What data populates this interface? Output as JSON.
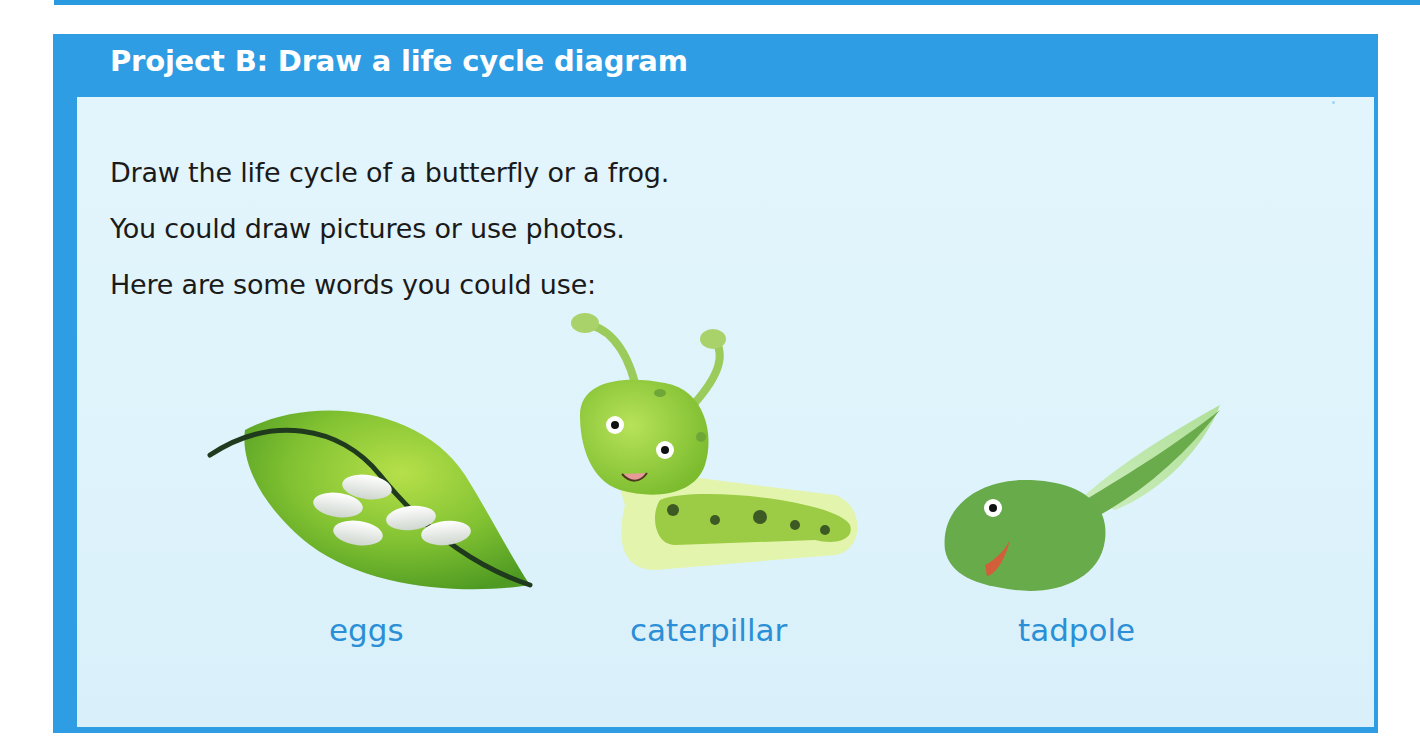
{
  "card": {
    "title": "Project B: Draw a life cycle diagram",
    "lines": [
      "Draw the life cycle of a butterfly or a frog.",
      "You could draw pictures or use photos.",
      "Here are some words you could use:"
    ],
    "words": [
      {
        "label": "eggs",
        "icon": "leaf-with-eggs-icon"
      },
      {
        "label": "caterpillar",
        "icon": "caterpillar-icon"
      },
      {
        "label": "tadpole",
        "icon": "tadpole-icon"
      }
    ]
  },
  "colors": {
    "header_blue": "#2e9de3",
    "panel_bg": "#e0f4fb",
    "word_blue": "#2a8fd6",
    "text_dark": "#1a1a1a"
  }
}
